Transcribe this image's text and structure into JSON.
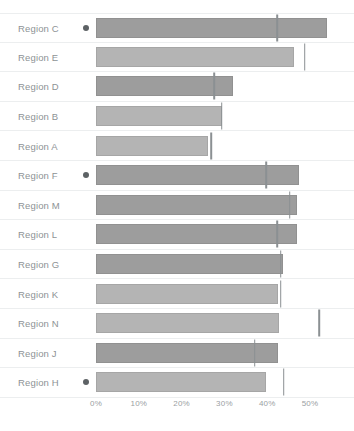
{
  "chart_data": {
    "type": "bar",
    "title": "",
    "subtitle": "",
    "xlabel": "",
    "ylabel": "",
    "orientation": "horizontal",
    "grid": false,
    "legend": "none",
    "xlim": [
      0,
      55
    ],
    "xtick_labels": [
      "0%",
      "10%",
      "20%",
      "30%",
      "40%",
      "50%"
    ],
    "xtick_values": [
      0,
      10,
      20,
      30,
      40,
      50
    ],
    "categories": [
      "Region C",
      "Region E",
      "Region D",
      "Region B",
      "Region A",
      "Region F",
      "Region M",
      "Region L",
      "Region G",
      "Region K",
      "Region N",
      "Region J",
      "Region H"
    ],
    "series": [
      {
        "name": "Value",
        "values": [
          54.0,
          46.3,
          32.0,
          29.4,
          26.2,
          47.4,
          47.0,
          47.0,
          43.7,
          42.5,
          42.8,
          42.5,
          39.7
        ]
      },
      {
        "name": "Target",
        "values": [
          42.3,
          48.8,
          27.6,
          29.4,
          26.9,
          39.7,
          45.3,
          42.3,
          43.2,
          43.2,
          52.1,
          37.1,
          43.9
        ]
      }
    ],
    "marked_categories": [
      "Region C",
      "Region F",
      "Region H"
    ],
    "colors": {
      "bar_dark": "#9d9d9d",
      "bar_light": "#b4b4b4",
      "target_marker": "#8b9093",
      "row_divider": "#eceeef",
      "label_text": "#8d9295",
      "tick_text": "#9aa0a3",
      "dot_marker": "#5d6265",
      "background": "#ffffff"
    }
  },
  "rows": [
    {
      "label": "Region C",
      "value": 54.0,
      "target": 42.3,
      "dot": true,
      "shade": "dark"
    },
    {
      "label": "Region E",
      "value": 46.3,
      "target": 48.8,
      "dot": false,
      "shade": "light"
    },
    {
      "label": "Region D",
      "value": 32.0,
      "target": 27.6,
      "dot": false,
      "shade": "dark"
    },
    {
      "label": "Region B",
      "value": 29.4,
      "target": 29.4,
      "dot": false,
      "shade": "light"
    },
    {
      "label": "Region A",
      "value": 26.2,
      "target": 26.9,
      "dot": false,
      "shade": "light"
    },
    {
      "label": "Region F",
      "value": 47.4,
      "target": 39.7,
      "dot": true,
      "shade": "dark"
    },
    {
      "label": "Region M",
      "value": 47.0,
      "target": 45.3,
      "dot": false,
      "shade": "dark"
    },
    {
      "label": "Region L",
      "value": 47.0,
      "target": 42.3,
      "dot": false,
      "shade": "dark"
    },
    {
      "label": "Region G",
      "value": 43.7,
      "target": 43.2,
      "dot": false,
      "shade": "dark"
    },
    {
      "label": "Region K",
      "value": 42.5,
      "target": 43.2,
      "dot": false,
      "shade": "light"
    },
    {
      "label": "Region N",
      "value": 42.8,
      "target": 52.1,
      "dot": false,
      "shade": "light"
    },
    {
      "label": "Region J",
      "value": 42.5,
      "target": 37.1,
      "dot": false,
      "shade": "dark"
    },
    {
      "label": "Region H",
      "value": 39.7,
      "target": 43.9,
      "dot": true,
      "shade": "light"
    }
  ],
  "axis": {
    "ticks": [
      "0%",
      "10%",
      "20%",
      "30%",
      "40%",
      "50%"
    ]
  }
}
